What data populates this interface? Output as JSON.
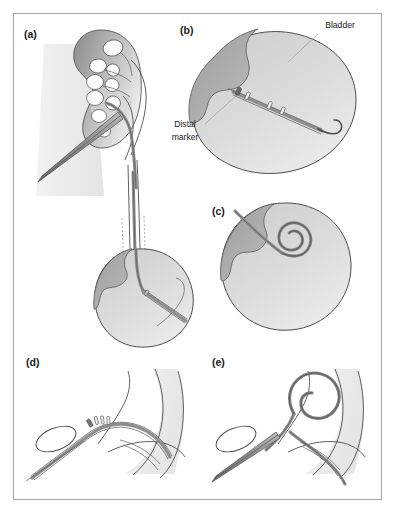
{
  "figure": {
    "border_color": "#a8a8a8",
    "background_color": "#ffffff",
    "line_color": "#4d4d4d",
    "shade_dark": "#9a9a9a",
    "shade_light": "#d6d6d6",
    "stent_color": "#8e8e8e"
  },
  "panels": [
    {
      "id": "a",
      "label": "(a)",
      "label_x": 24,
      "label_y": 38,
      "caption": "Kidney with calyces and proximal stent in renal pelvis, stent passing down ureter"
    },
    {
      "id": "b",
      "label": "(b)",
      "label_x": 180,
      "label_y": 34,
      "caption": "Bladder with stent and distal marker, hooked distal end"
    },
    {
      "id": "c",
      "label": "(c)",
      "label_x": 212,
      "label_y": 215,
      "caption": "Bladder with distal pigtail coil formed"
    },
    {
      "id": "d",
      "label": "(d)",
      "label_x": 26,
      "label_y": 366,
      "caption": "Renal pelvis close-up with straight stent and marker bands"
    },
    {
      "id": "e",
      "label": "(e)",
      "label_x": 212,
      "label_y": 366,
      "caption": "Renal pelvis close-up with proximal pigtail coil formed"
    }
  ],
  "annotations": [
    {
      "id": "bladder",
      "text": "Bladder",
      "text_x": 340,
      "text_y": 28,
      "anchor": "middle",
      "leader": "M 318 34 L 288 62"
    },
    {
      "id": "distal-marker",
      "text_lines": [
        "Distal",
        "marker"
      ],
      "line1": "Distal",
      "line2": "marker",
      "text_x": 185,
      "text_y1": 127,
      "text_y2": 140,
      "anchor": "middle",
      "leader": "M 205 124 L 237 95"
    }
  ],
  "colors": {
    "frame_stroke": "#a8a8a8",
    "organ_outline": "#4d4d4d",
    "bladder_light": "#d8d8d8",
    "bladder_dark": "#a6a6a6",
    "kidney_dark": "#8f8f8f",
    "kidney_light": "#e2e2e2",
    "calyx_fill": "#ffffff",
    "stent_gray": "#8e8e8e",
    "label_text": "#1a1a1a",
    "leader_line": "#9a9a9a"
  }
}
